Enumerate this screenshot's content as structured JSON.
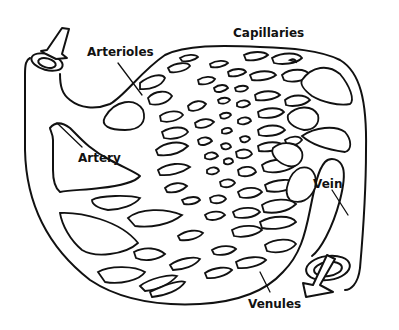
{
  "diagram": {
    "type": "anatomical-illustration",
    "labels": {
      "capillaries": "Capillaries",
      "arterioles": "Arterioles",
      "artery": "Artery",
      "vein": "Vein",
      "venules": "Venules"
    },
    "flow_direction": [
      "Artery",
      "Arterioles",
      "Capillaries",
      "Venules",
      "Vein"
    ],
    "colors": {
      "line": "#111111",
      "background": "#ffffff"
    }
  }
}
